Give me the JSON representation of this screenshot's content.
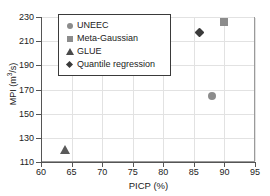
{
  "chart_data": {
    "type": "scatter",
    "title": "",
    "xlabel": "PICP (%)",
    "ylabel": "MPI (m3/s)",
    "ylabel_parts": {
      "pre": "MPI (m",
      "sup": "3",
      "post": "/s)"
    },
    "xlim": [
      60,
      95
    ],
    "ylim": [
      110,
      230
    ],
    "xticks": [
      60,
      65,
      70,
      75,
      80,
      85,
      90,
      95
    ],
    "yticks": [
      110,
      130,
      150,
      170,
      190,
      210,
      230
    ],
    "grid": true,
    "legend_position": "upper-left-inside",
    "series": [
      {
        "name": "UNEEC",
        "marker": "circle",
        "color": "#8c8c8c",
        "points": [
          {
            "x": 88,
            "y": 165
          }
        ]
      },
      {
        "name": "Meta-Gaussian",
        "marker": "square",
        "color": "#8c8c8c",
        "points": [
          {
            "x": 90,
            "y": 226
          }
        ]
      },
      {
        "name": "GLUE",
        "marker": "triangle",
        "color": "#5a5a5a",
        "points": [
          {
            "x": 64,
            "y": 120
          }
        ]
      },
      {
        "name": "Quantile regression",
        "marker": "diamond",
        "color": "#3a3a3a",
        "points": [
          {
            "x": 86,
            "y": 217
          }
        ]
      }
    ]
  },
  "legend": {
    "items": [
      {
        "label": "UNEEC",
        "icon": "circle-marker-icon"
      },
      {
        "label": "Meta-Gaussian",
        "icon": "square-marker-icon"
      },
      {
        "label": "GLUE",
        "icon": "triangle-marker-icon"
      },
      {
        "label": "Quantile regression",
        "icon": "diamond-marker-icon"
      }
    ]
  }
}
